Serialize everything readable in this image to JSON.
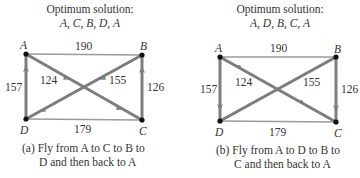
{
  "panels": [
    {
      "id": "a",
      "title_line1": "Optimum solution:",
      "title_line2": "A, C, B, D, A",
      "nodes": {
        "A": "A",
        "B": "B",
        "C": "C",
        "D": "D"
      },
      "weights": {
        "AB": "190",
        "AD": "157",
        "AC": "124",
        "BD": "155",
        "BC": "126",
        "DC": "179"
      },
      "caption_line1": "(a) Fly from A to C to B to",
      "caption_line2": "D and then back to A"
    },
    {
      "id": "b",
      "title_line1": "Optimum solution:",
      "title_line2": "A, D, B, C, A",
      "nodes": {
        "A": "A",
        "B": "B",
        "C": "C",
        "D": "D"
      },
      "weights": {
        "AB": "190",
        "AD": "157",
        "AC": "124",
        "BD": "155",
        "BC": "126",
        "DC": "179"
      },
      "caption_line1": "(b) Fly from A to D to B to",
      "caption_line2": "C and then back to A"
    }
  ],
  "colors": {
    "edge_light": "#9a9a9a",
    "edge_route": "#7d7d7d",
    "node": "#111111",
    "text": "#333333"
  }
}
